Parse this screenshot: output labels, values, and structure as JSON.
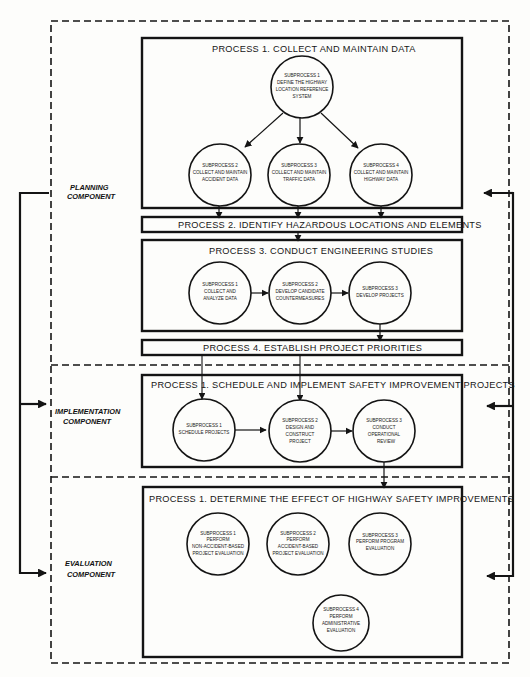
{
  "components": {
    "planning": {
      "label_line1": "PLANNING",
      "label_line2": "COMPONENT",
      "processes": {
        "p1": {
          "title": "PROCESS 1.  COLLECT AND MAINTAIN DATA",
          "subprocesses": [
            {
              "lines": [
                "SUBPROCESS 1",
                "DEFINE THE HIGHWAY",
                "LOCATION REFERENCE",
                "SYSTEM"
              ]
            },
            {
              "lines": [
                "SUBPROCESS 2",
                "COLLECT AND MAINTAIN",
                "ACCIDENT DATA"
              ]
            },
            {
              "lines": [
                "SUBPROCESS 3",
                "COLLECT AND MAINTAIN",
                "TRAFFIC DATA"
              ]
            },
            {
              "lines": [
                "SUBPROCESS 4",
                "COLLECT AND MAINTAIN",
                "HIGHWAY DATA"
              ]
            }
          ]
        },
        "p2": {
          "title": "PROCESS 2.  IDENTIFY HAZARDOUS LOCATIONS AND ELEMENTS"
        },
        "p3": {
          "title": "PROCESS 3.  CONDUCT ENGINEERING STUDIES",
          "subprocesses": [
            {
              "lines": [
                "SUBPROCESS 1",
                "COLLECT AND",
                "ANALYZE DATA"
              ]
            },
            {
              "lines": [
                "SUBPROCESS 2",
                "DEVELOP CANDIDATE",
                "COUNTERMEASURES"
              ]
            },
            {
              "lines": [
                "SUBPROCESS 3",
                "DEVELOP PROJECTS"
              ]
            }
          ]
        },
        "p4": {
          "title": "PROCESS 4.  ESTABLISH PROJECT PRIORITIES"
        }
      }
    },
    "implementation": {
      "label_line1": "IMPLEMENTATION",
      "label_line2": "COMPONENT",
      "processes": {
        "p1": {
          "title": "PROCESS 1.  SCHEDULE AND IMPLEMENT SAFETY IMPROVEMENT PROJECTS",
          "subprocesses": [
            {
              "lines": [
                "SUBPROCESS 1",
                "SCHEDULE PROJECTS"
              ]
            },
            {
              "lines": [
                "SUBPROCESS 2",
                "DESIGN AND",
                "CONSTRUCT",
                "PROJECT"
              ]
            },
            {
              "lines": [
                "SUBPROCESS 3",
                "CONDUCT",
                "OPERATIONAL",
                "REVIEW"
              ]
            }
          ]
        }
      }
    },
    "evaluation": {
      "label_line1": "EVALUATION",
      "label_line2": "COMPONENT",
      "processes": {
        "p1": {
          "title": "PROCESS 1.  DETERMINE THE EFFECT OF HIGHWAY SAFETY IMPROVEMENTS",
          "subprocesses": [
            {
              "lines": [
                "SUBPROCESS 1",
                "PERFORM",
                "NON-ACCIDENT-BASED",
                "PROJECT EVALUATION"
              ]
            },
            {
              "lines": [
                "SUBPROCESS 2",
                "PERFORM",
                "ACCIDENT-BASED",
                "PROJECT EVALUATION"
              ]
            },
            {
              "lines": [
                "SUBPROCESS 3",
                "PERFORM PROGRAM",
                "EVALUATION"
              ]
            },
            {
              "lines": [
                "SUBPROCESS 4",
                "PERFORM",
                "ADMINISTRATIVE",
                "EVALUATION"
              ]
            }
          ]
        }
      }
    }
  },
  "colors": {
    "ink": "#141414",
    "paper": "#fdfdfb"
  }
}
